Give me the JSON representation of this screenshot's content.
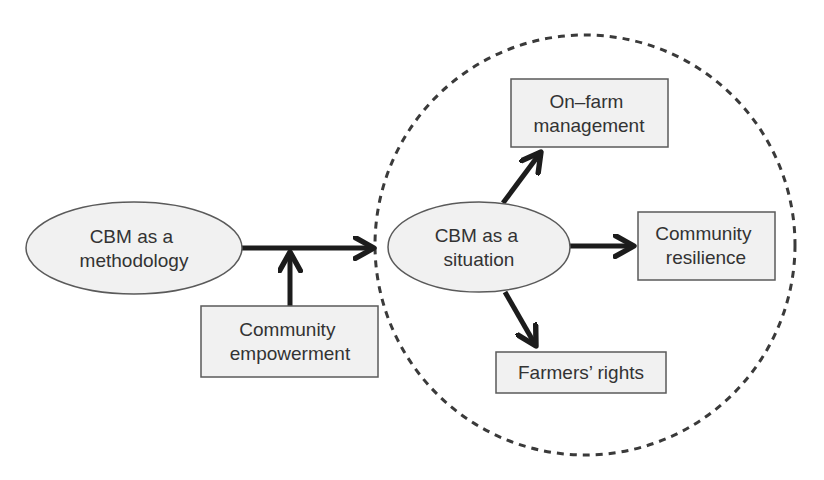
{
  "diagram": {
    "type": "concept-flow",
    "colors": {
      "node_fill": "#f1f1f1",
      "node_stroke": "#5a5a5a",
      "arrow": "#1c1c1c",
      "text": "#333333",
      "dashed_boundary": "#3a3a3a"
    },
    "nodes": {
      "methodology": {
        "shape": "ellipse",
        "line1": "CBM as a",
        "line2": "methodology"
      },
      "empowerment": {
        "shape": "rect",
        "line1": "Community",
        "line2": "empowerment"
      },
      "situation": {
        "shape": "ellipse",
        "line1": "CBM as a",
        "line2": "situation"
      },
      "onfarm": {
        "shape": "rect",
        "line1": "On–farm",
        "line2": "management"
      },
      "resilience": {
        "shape": "rect",
        "line1": "Community",
        "line2": "resilience"
      },
      "rights": {
        "shape": "rect",
        "line1": "Farmers’ rights"
      }
    },
    "edges": [
      {
        "from": "methodology",
        "to": "situation-boundary"
      },
      {
        "from": "empowerment",
        "to": "methodology-edge"
      },
      {
        "from": "situation",
        "to": "onfarm"
      },
      {
        "from": "situation",
        "to": "resilience"
      },
      {
        "from": "situation",
        "to": "rights"
      }
    ],
    "boundary": {
      "shape": "dashed-circle",
      "encloses": [
        "situation",
        "onfarm",
        "resilience",
        "rights"
      ]
    }
  }
}
